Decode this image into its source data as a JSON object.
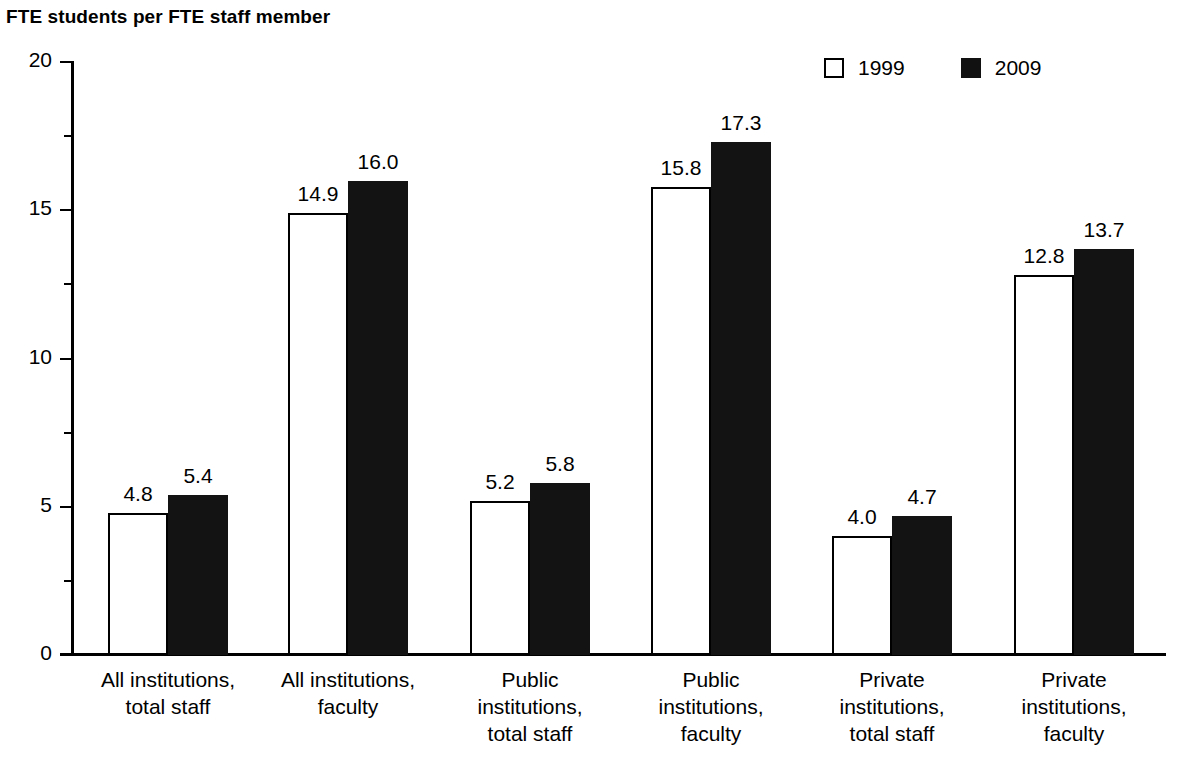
{
  "chart_data": {
    "type": "bar",
    "title": "FTE students per FTE staff member",
    "xlabel": "",
    "ylabel": "",
    "ylim": [
      0,
      20
    ],
    "yticks": [
      0,
      5,
      10,
      15,
      20
    ],
    "ytick_labels": [
      "0",
      "5",
      "10",
      "15",
      "20"
    ],
    "yminor_ticks": [
      2.5,
      7.5,
      12.5,
      17.5
    ],
    "grid": false,
    "legend_position": "top-right",
    "categories": [
      "All institutions,\ntotal staff",
      "All institutions,\nfaculty",
      "Public\ninstitutions,\ntotal staff",
      "Public\ninstitutions,\nfaculty",
      "Private\ninstitutions,\ntotal staff",
      "Private\ninstitutions,\nfaculty"
    ],
    "series": [
      {
        "name": "1999",
        "style": "hollow",
        "color": "#ffffff",
        "values": [
          4.8,
          14.9,
          5.2,
          15.8,
          4.0,
          12.8
        ],
        "labels": [
          "4.8",
          "14.9",
          "5.2",
          "15.8",
          "4.0",
          "12.8"
        ]
      },
      {
        "name": "2009",
        "style": "filled",
        "color": "#131313",
        "values": [
          5.4,
          16.0,
          5.8,
          17.3,
          4.7,
          13.7
        ],
        "labels": [
          "5.4",
          "16.0",
          "5.8",
          "17.3",
          "4.7",
          "13.7"
        ]
      }
    ]
  },
  "legend": {
    "items": [
      {
        "label": "1999",
        "swatch": "hollow-square-icon"
      },
      {
        "label": "2009",
        "swatch": "filled-square-icon"
      }
    ]
  }
}
